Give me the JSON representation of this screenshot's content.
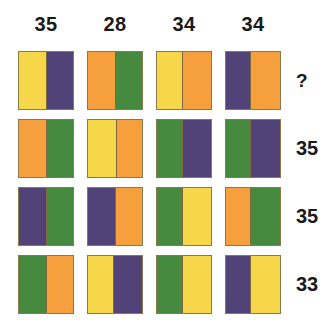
{
  "puzzle": {
    "title": "colour-block matrix puzzle",
    "colors": {
      "yellow": "#F7D74A",
      "purple": "#514278",
      "orange": "#F5A03C",
      "green": "#458A3E",
      "border": "#8A7A4A",
      "text": "#1A1A1A",
      "background": "#FFFFFF"
    },
    "column_headers": [
      "35",
      "28",
      "34",
      "34"
    ],
    "row_labels": [
      "?",
      "35",
      "35",
      "33"
    ],
    "rows": [
      {
        "label": "?",
        "cells": [
          {
            "left": "yellow",
            "right": "purple",
            "left_pct": 50,
            "right_pct": 50
          },
          {
            "left": "orange",
            "right": "green",
            "left_pct": 50,
            "right_pct": 50
          },
          {
            "left": "yellow",
            "right": "orange",
            "left_pct": 48,
            "right_pct": 52
          },
          {
            "left": "purple",
            "right": "orange",
            "left_pct": 45,
            "right_pct": 55
          }
        ]
      },
      {
        "label": "35",
        "cells": [
          {
            "left": "orange",
            "right": "green",
            "left_pct": 50,
            "right_pct": 50
          },
          {
            "left": "yellow",
            "right": "orange",
            "left_pct": 52,
            "right_pct": 48
          },
          {
            "left": "green",
            "right": "purple",
            "left_pct": 48,
            "right_pct": 52
          },
          {
            "left": "green",
            "right": "purple",
            "left_pct": 45,
            "right_pct": 55
          }
        ]
      },
      {
        "label": "35",
        "cells": [
          {
            "left": "purple",
            "right": "green",
            "left_pct": 50,
            "right_pct": 50
          },
          {
            "left": "purple",
            "right": "orange",
            "left_pct": 50,
            "right_pct": 50
          },
          {
            "left": "green",
            "right": "yellow",
            "left_pct": 48,
            "right_pct": 52
          },
          {
            "left": "orange",
            "right": "green",
            "left_pct": 45,
            "right_pct": 55
          }
        ]
      },
      {
        "label": "33",
        "cells": [
          {
            "left": "green",
            "right": "orange",
            "left_pct": 50,
            "right_pct": 50
          },
          {
            "left": "yellow",
            "right": "purple",
            "left_pct": 48,
            "right_pct": 52
          },
          {
            "left": "green",
            "right": "yellow",
            "left_pct": 48,
            "right_pct": 52
          },
          {
            "left": "purple",
            "right": "yellow",
            "left_pct": 45,
            "right_pct": 55
          }
        ]
      }
    ]
  }
}
